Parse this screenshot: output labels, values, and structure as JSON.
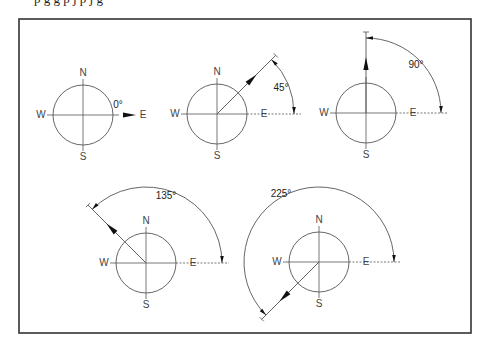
{
  "page": {
    "cut_text": "p   g   g          p                              j   p   j     g"
  },
  "frame": {
    "x": 19,
    "y": 19,
    "w": 452,
    "h": 314,
    "stroke": "#333333"
  },
  "compass_labels": {
    "n": "N",
    "s": "S",
    "e": "E",
    "w": "W"
  },
  "compasses": [
    {
      "id": "0",
      "cx": 83,
      "cy": 115,
      "r": 30,
      "angle_deg": 0,
      "angle_label": "0°",
      "show_n": true,
      "arc_r": 0,
      "label_x": 118,
      "label_y": 105
    },
    {
      "id": "45",
      "cx": 217,
      "cy": 114,
      "r": 30,
      "angle_deg": 45,
      "angle_label": "45°",
      "show_n": true,
      "arc_r": 77,
      "label_x": 281,
      "label_y": 88
    },
    {
      "id": "90",
      "cx": 366,
      "cy": 113,
      "r": 30,
      "angle_deg": 90,
      "angle_label": "90°",
      "show_n": false,
      "arc_r": 75,
      "label_x": 416,
      "label_y": 65
    },
    {
      "id": "135",
      "cx": 146,
      "cy": 263,
      "r": 30,
      "angle_deg": 135,
      "angle_label": "135°",
      "show_n": true,
      "arc_r": 76,
      "label_x": 166,
      "label_y": 196
    },
    {
      "id": "225",
      "cx": 319,
      "cy": 262,
      "r": 30,
      "angle_deg": 225,
      "angle_label": "225°",
      "show_n": true,
      "arc_r": 75,
      "label_x": 281,
      "label_y": 194
    }
  ],
  "colors": {
    "line": "#555555",
    "dash": "#555555",
    "arrow": "#111111"
  }
}
